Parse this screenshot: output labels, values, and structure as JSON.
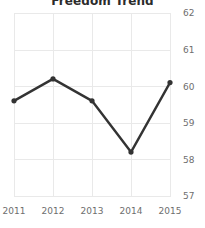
{
  "chart_data": {
    "type": "line",
    "title": "Freedom Trend",
    "xlabel": "",
    "ylabel": "",
    "categories": [
      "2011",
      "2012",
      "2013",
      "2014",
      "2015"
    ],
    "x": [
      2011,
      2012,
      2013,
      2014,
      2015
    ],
    "values": [
      59.6,
      60.2,
      59.6,
      58.2,
      60.1
    ],
    "series": [
      {
        "name": "Freedom Trend",
        "values": [
          59.6,
          60.2,
          59.6,
          58.2,
          60.1
        ]
      }
    ],
    "ylim": [
      56.6,
      62.4
    ],
    "xlim": [
      2010.8,
      2015.2
    ],
    "yticks": [
      57,
      58,
      59,
      60,
      61,
      62
    ],
    "ytick_labels": [
      "57",
      "58",
      "59",
      "60",
      "61",
      "62"
    ],
    "xticks": [
      2011,
      2012,
      2013,
      2014,
      2015
    ],
    "xtick_labels": [
      "2011",
      "2012",
      "2013",
      "2014",
      "2015"
    ],
    "grid": true,
    "grid_axis": "both",
    "legend": false,
    "legend_position": "none",
    "y_axis_side": "right",
    "markers": true,
    "line_color": "#333333",
    "grid_color": "#e9e9e9",
    "tick_label_color": "#6e6e6e",
    "title_color": "#2b2b2b",
    "background_color": "#ffffff"
  }
}
